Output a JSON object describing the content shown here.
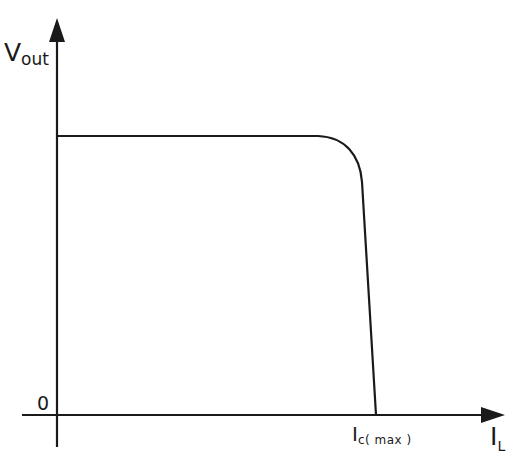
{
  "diagram": {
    "type": "voltage-vs-load-current characteristic",
    "y_axis": {
      "label_main": "V",
      "label_sub": "out"
    },
    "x_axis": {
      "label_main": "I",
      "label_sub": "L"
    },
    "origin_label": "0",
    "x_tick": {
      "label_main": "I",
      "label_sub": "c( max )"
    },
    "colors": {
      "line": "#1a1a1a",
      "background": "#ffffff"
    },
    "curve": {
      "description": "Flat output voltage up to near Ic(max), rounded knee, then steep drop to zero at Ic(max)",
      "points_px": [
        [
          57,
          136
        ],
        [
          320,
          136
        ],
        [
          362,
          180
        ],
        [
          376,
          415
        ]
      ]
    }
  }
}
